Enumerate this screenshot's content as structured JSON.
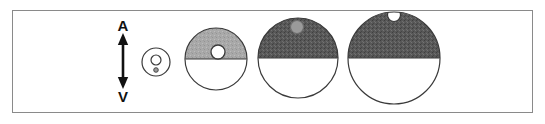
{
  "figure": {
    "caption_letters": {
      "top_label": "A",
      "bottom_label": "V"
    },
    "frame": {
      "border_color": "#8a8a8a",
      "background_color": "#ffffff"
    },
    "axis_arrow": {
      "name": "vertical-double-headed-arrow",
      "color": "#111111",
      "orientation": "vertical",
      "double_headed": true
    },
    "palette": {
      "outline": "#3a3a3a",
      "light_gray_shade": "#a9a9a9",
      "dark_gray_shade": "#585858",
      "mid_gray_spot": "#9a9a9a",
      "white": "#ffffff"
    },
    "spheres": [
      {
        "index": 1,
        "name": "sphere-smallest",
        "cx": 156,
        "cy": 62,
        "r": 14,
        "top_fill": "#ffffff",
        "bottom_fill": "#ffffff",
        "outline": "#3a3a3a",
        "spot": {
          "cx": 156,
          "cy": 60,
          "r": 5,
          "fill": "#ffffff",
          "outline": "#3a3a3a"
        },
        "dot": {
          "cx": 156,
          "cy": 70,
          "r": 2.2,
          "fill": "#9a9a9a",
          "outline": "#3a3a3a"
        }
      },
      {
        "index": 2,
        "name": "sphere-small",
        "cx": 216,
        "cy": 59,
        "r": 31,
        "top_fill": "#a9a9a9",
        "bottom_fill": "#ffffff",
        "outline": "#3a3a3a",
        "spot": {
          "cx": 218,
          "cy": 52,
          "r": 7,
          "fill": "#ffffff",
          "outline": "#3a3a3a"
        },
        "dot": null
      },
      {
        "index": 3,
        "name": "sphere-medium",
        "cx": 298,
        "cy": 58,
        "r": 40,
        "top_fill": "#585858",
        "bottom_fill": "#ffffff",
        "outline": "#3a3a3a",
        "spot": {
          "cx": 297,
          "cy": 27,
          "r": 6.5,
          "fill": "#9a9a9a",
          "outline": "#6f6f6f"
        },
        "dot": null
      },
      {
        "index": 4,
        "name": "sphere-large",
        "cx": 394,
        "cy": 58,
        "r": 46,
        "top_fill": "#585858",
        "bottom_fill": "#ffffff",
        "outline": "#3a3a3a",
        "spot": {
          "cx": 394,
          "cy": 15,
          "r": 6.5,
          "fill": "#ffffff",
          "outline": "#3a3a3a"
        },
        "dot": null
      }
    ]
  }
}
